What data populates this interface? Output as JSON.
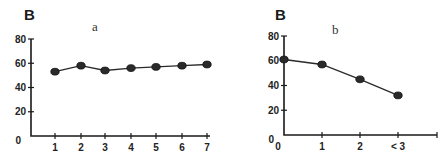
{
  "chart_data": [
    {
      "type": "line",
      "panel": "B",
      "title": "a",
      "xlabel": "",
      "ylabel": "",
      "categories": [
        "1",
        "2",
        "3",
        "4",
        "5",
        "6",
        "7"
      ],
      "values": [
        53,
        58,
        54,
        56,
        57,
        58,
        59
      ],
      "y_ticks": [
        "80",
        "60",
        "40",
        "20",
        "0"
      ],
      "ylim": [
        0,
        80
      ],
      "grid": false,
      "legend": null
    },
    {
      "type": "line",
      "panel": "B",
      "title": "b",
      "xlabel": "",
      "ylabel": "",
      "categories": [
        "0",
        "1",
        "2",
        "< 3"
      ],
      "values": [
        61,
        57,
        45,
        32
      ],
      "y_ticks": [
        "80",
        "60",
        "40",
        "20",
        "0"
      ],
      "ylim": [
        0,
        80
      ],
      "grid": false,
      "legend": null
    }
  ],
  "layout": {
    "left": {
      "origin_x": 31,
      "origin_y": 136,
      "y_top": 39,
      "x_end": 210,
      "x_positions": [
        55,
        81,
        105,
        131,
        156,
        182,
        207
      ],
      "ytick_values": [
        80,
        60,
        40,
        20
      ],
      "panel_letter_pos": [
        24,
        20
      ],
      "title_pos": [
        92,
        31
      ]
    },
    "right": {
      "origin_x": 284,
      "origin_y": 135,
      "y_top": 36,
      "x_end": 437,
      "x_positions": [
        284,
        322,
        360,
        398
      ],
      "ytick_values": [
        80,
        60,
        40,
        20
      ],
      "extra_xtick": 437,
      "panel_letter_pos": [
        275,
        20
      ],
      "title_pos": [
        332,
        34
      ]
    }
  }
}
